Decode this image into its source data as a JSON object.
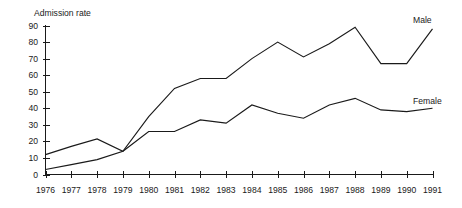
{
  "chart_data": {
    "type": "line",
    "title": "",
    "ylabel": "Admission rate",
    "xlabel": "",
    "categories": [
      "1976",
      "1977",
      "1978",
      "1979",
      "1980",
      "1981",
      "1982",
      "1983",
      "1984",
      "1985",
      "1986",
      "1987",
      "1988",
      "1989",
      "1990",
      "1991"
    ],
    "x": [
      1976,
      1977,
      1978,
      1979,
      1980,
      1981,
      1982,
      1983,
      1984,
      1985,
      1986,
      1987,
      1988,
      1989,
      1990,
      1991
    ],
    "series": [
      {
        "name": "Male",
        "label": "Male",
        "values": [
          3,
          6,
          9,
          14,
          35,
          52,
          58,
          58,
          70,
          80,
          71,
          79,
          89,
          67,
          67,
          88
        ]
      },
      {
        "name": "Female",
        "label": "Female",
        "values": [
          12,
          17,
          21.5,
          14,
          26,
          26,
          33,
          31,
          42,
          37,
          34,
          42,
          46,
          39,
          38,
          40
        ]
      }
    ],
    "ylim": [
      0,
      90
    ],
    "yticks": [
      0,
      10,
      20,
      30,
      40,
      50,
      60,
      70,
      80,
      90
    ],
    "ytick_labels": [
      "0",
      "10",
      "20",
      "30",
      "40",
      "50",
      "60",
      "70",
      "80",
      "90"
    ],
    "xlim": [
      1976,
      1991
    ],
    "grid": false,
    "legend_position": "inline-right-end",
    "line_color": "#1a1a1a",
    "background_color": "#ffffff"
  }
}
